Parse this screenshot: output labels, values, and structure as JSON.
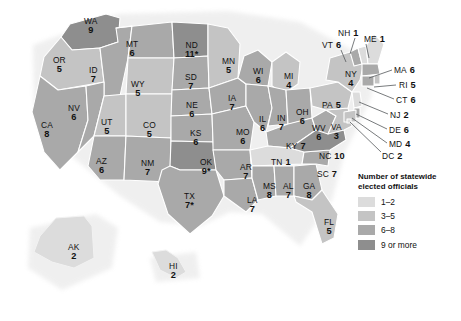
{
  "map": {
    "title": "United States statewide elected officials choropleth map",
    "legend": {
      "title_line1": "Number of statewide",
      "title_line2": "elected officials",
      "items": [
        {
          "label": "1–2",
          "color": "#dcdcdc"
        },
        {
          "label": "3–5",
          "color": "#c4c4c4"
        },
        {
          "label": "6–8",
          "color": "#a9a9a9"
        },
        {
          "label": "9 or more",
          "color": "#8e8e8e"
        }
      ]
    },
    "colors": {
      "bin_1_2": "#dcdcdc",
      "bin_3_5": "#c4c4c4",
      "bin_6_8": "#a9a9a9",
      "bin_9_plus": "#8e8e8e",
      "border": "#ffffff",
      "leader_line": "#55595c",
      "text": "#111111",
      "background": "#ffffff"
    },
    "states": [
      {
        "id": "WA",
        "abbr": "WA",
        "value": "9",
        "bin": "bin_9_plus",
        "x": 84,
        "y": 17,
        "style": "stacked"
      },
      {
        "id": "OR",
        "abbr": "OR",
        "value": "5",
        "bin": "bin_3_5",
        "x": 53,
        "y": 56,
        "style": "stacked"
      },
      {
        "id": "CA",
        "abbr": "CA",
        "value": "8",
        "bin": "bin_6_8",
        "x": 41,
        "y": 121,
        "style": "stacked"
      },
      {
        "id": "ID",
        "abbr": "ID",
        "value": "7",
        "bin": "bin_6_8",
        "x": 89,
        "y": 66,
        "style": "stacked"
      },
      {
        "id": "NV",
        "abbr": "NV",
        "value": "6",
        "bin": "bin_6_8",
        "x": 68,
        "y": 104,
        "style": "stacked"
      },
      {
        "id": "MT",
        "abbr": "MT",
        "value": "6",
        "bin": "bin_6_8",
        "x": 126,
        "y": 40,
        "style": "stacked"
      },
      {
        "id": "WY",
        "abbr": "WY",
        "value": "5",
        "bin": "bin_3_5",
        "x": 131,
        "y": 80,
        "style": "stacked"
      },
      {
        "id": "UT",
        "abbr": "UT",
        "value": "5",
        "bin": "bin_3_5",
        "x": 101,
        "y": 118,
        "style": "stacked"
      },
      {
        "id": "CO",
        "abbr": "CO",
        "value": "5",
        "bin": "bin_3_5",
        "x": 143,
        "y": 121,
        "style": "stacked"
      },
      {
        "id": "AZ",
        "abbr": "AZ",
        "value": "6",
        "bin": "bin_6_8",
        "x": 96,
        "y": 157,
        "style": "stacked"
      },
      {
        "id": "NM",
        "abbr": "NM",
        "value": "7",
        "bin": "bin_6_8",
        "x": 141,
        "y": 159,
        "style": "stacked"
      },
      {
        "id": "ND",
        "abbr": "ND",
        "value": "11*",
        "bin": "bin_9_plus",
        "x": 185,
        "y": 41,
        "style": "stacked"
      },
      {
        "id": "SD",
        "abbr": "SD",
        "value": "7",
        "bin": "bin_6_8",
        "x": 185,
        "y": 73,
        "style": "stacked"
      },
      {
        "id": "NE",
        "abbr": "NE",
        "value": "6",
        "bin": "bin_6_8",
        "x": 186,
        "y": 101,
        "style": "stacked"
      },
      {
        "id": "KS",
        "abbr": "KS",
        "value": "6",
        "bin": "bin_6_8",
        "x": 190,
        "y": 129,
        "style": "stacked"
      },
      {
        "id": "OK",
        "abbr": "OK",
        "value": "9*",
        "bin": "bin_9_plus",
        "x": 200,
        "y": 158,
        "style": "stacked"
      },
      {
        "id": "TX",
        "abbr": "TX",
        "value": "7*",
        "bin": "bin_6_8",
        "x": 184,
        "y": 192,
        "style": "stacked"
      },
      {
        "id": "MN",
        "abbr": "MN",
        "value": "5",
        "bin": "bin_3_5",
        "x": 222,
        "y": 57,
        "style": "stacked"
      },
      {
        "id": "IA",
        "abbr": "IA",
        "value": "7",
        "bin": "bin_6_8",
        "x": 228,
        "y": 94,
        "style": "stacked"
      },
      {
        "id": "MO",
        "abbr": "MO",
        "value": "6",
        "bin": "bin_6_8",
        "x": 236,
        "y": 128,
        "style": "stacked"
      },
      {
        "id": "AR",
        "abbr": "AR",
        "value": "7",
        "bin": "bin_6_8",
        "x": 240,
        "y": 163,
        "style": "stacked"
      },
      {
        "id": "LA",
        "abbr": "LA",
        "value": "7",
        "bin": "bin_6_8",
        "x": 247,
        "y": 196,
        "style": "stacked"
      },
      {
        "id": "WI",
        "abbr": "WI",
        "value": "6",
        "bin": "bin_6_8",
        "x": 253,
        "y": 67,
        "style": "stacked"
      },
      {
        "id": "IL",
        "abbr": "IL",
        "value": "6",
        "bin": "bin_6_8",
        "x": 259,
        "y": 115,
        "style": "stacked"
      },
      {
        "id": "MI",
        "abbr": "MI",
        "value": "4",
        "bin": "bin_3_5",
        "x": 284,
        "y": 72,
        "style": "stacked"
      },
      {
        "id": "IN",
        "abbr": "IN",
        "value": "7",
        "bin": "bin_6_8",
        "x": 277,
        "y": 114,
        "style": "stacked"
      },
      {
        "id": "OH",
        "abbr": "OH",
        "value": "6",
        "bin": "bin_6_8",
        "x": 296,
        "y": 108,
        "style": "stacked"
      },
      {
        "id": "KY",
        "abbr": "KY",
        "value": "7",
        "bin": "bin_6_8",
        "x": 286,
        "y": 142,
        "style": "inline"
      },
      {
        "id": "TN",
        "abbr": "TN",
        "value": "1",
        "bin": "bin_1_2",
        "x": 271,
        "y": 158,
        "style": "inline"
      },
      {
        "id": "MS",
        "abbr": "MS",
        "value": "8",
        "bin": "bin_6_8",
        "x": 263,
        "y": 182,
        "style": "stacked"
      },
      {
        "id": "AL",
        "abbr": "AL",
        "value": "7",
        "bin": "bin_6_8",
        "x": 283,
        "y": 182,
        "style": "stacked"
      },
      {
        "id": "GA",
        "abbr": "GA",
        "value": "8",
        "bin": "bin_6_8",
        "x": 303,
        "y": 182,
        "style": "stacked"
      },
      {
        "id": "FL",
        "abbr": "FL",
        "value": "5",
        "bin": "bin_3_5",
        "x": 324,
        "y": 218,
        "style": "stacked"
      },
      {
        "id": "SC",
        "abbr": "SC",
        "value": "7",
        "bin": "bin_6_8",
        "x": 317,
        "y": 170,
        "style": "inline"
      },
      {
        "id": "NC",
        "abbr": "NC",
        "value": "10",
        "bin": "bin_9_plus",
        "x": 319,
        "y": 152,
        "style": "inline"
      },
      {
        "id": "WV",
        "abbr": "WV",
        "value": "6",
        "bin": "bin_6_8",
        "x": 312,
        "y": 124,
        "style": "stacked"
      },
      {
        "id": "VA",
        "abbr": "VA",
        "value": "3",
        "bin": "bin_3_5",
        "x": 331,
        "y": 123,
        "style": "stacked"
      },
      {
        "id": "PA",
        "abbr": "PA",
        "value": "5",
        "bin": "bin_3_5",
        "x": 322,
        "y": 101,
        "style": "inline"
      },
      {
        "id": "NY",
        "abbr": "NY",
        "value": "4",
        "bin": "bin_3_5",
        "x": 345,
        "y": 70,
        "style": "stacked"
      },
      {
        "id": "AK",
        "abbr": "AK",
        "value": "2",
        "bin": "bin_1_2",
        "x": 68,
        "y": 243,
        "style": "stacked"
      },
      {
        "id": "HI",
        "abbr": "HI",
        "value": "2",
        "bin": "bin_1_2",
        "x": 169,
        "y": 262,
        "style": "stacked"
      }
    ],
    "callouts": [
      {
        "id": "NH",
        "abbr": "NH",
        "value": "1",
        "x": 338,
        "y": 29,
        "lx1": 355,
        "ly1": 38,
        "lx2": 350,
        "ly2": 54
      },
      {
        "id": "VT",
        "abbr": "VT",
        "value": "6",
        "x": 322,
        "y": 41,
        "lx1": 341,
        "ly1": 50,
        "lx2": 346,
        "ly2": 62
      },
      {
        "id": "ME",
        "abbr": "ME",
        "value": "1",
        "x": 364,
        "y": 35,
        "lx1": 366,
        "ly1": 44,
        "lx2": 369,
        "ly2": 58
      },
      {
        "id": "MA",
        "abbr": "MA",
        "value": "6",
        "x": 394,
        "y": 66,
        "lx1": 392,
        "ly1": 70,
        "lx2": 369,
        "ly2": 78
      },
      {
        "id": "RI",
        "abbr": "RI",
        "value": "5",
        "x": 399,
        "y": 81,
        "lx1": 396,
        "ly1": 85,
        "lx2": 374,
        "ly2": 87
      },
      {
        "id": "CT",
        "abbr": "CT",
        "value": "6",
        "x": 396,
        "y": 96,
        "lx1": 394,
        "ly1": 99,
        "lx2": 367,
        "ly2": 88
      },
      {
        "id": "NJ",
        "abbr": "NJ",
        "value": "2",
        "x": 390,
        "y": 111,
        "lx1": 388,
        "ly1": 114,
        "lx2": 359,
        "ly2": 102
      },
      {
        "id": "DE",
        "abbr": "DE",
        "value": "6",
        "x": 389,
        "y": 126,
        "lx1": 387,
        "ly1": 129,
        "lx2": 356,
        "ly2": 114
      },
      {
        "id": "MD",
        "abbr": "MD",
        "value": "4",
        "x": 389,
        "y": 140,
        "lx1": 387,
        "ly1": 143,
        "lx2": 352,
        "ly2": 118
      },
      {
        "id": "DC",
        "abbr": "DC",
        "value": "2",
        "x": 382,
        "y": 152,
        "lx1": 381,
        "ly1": 152,
        "lx2": 350,
        "ly2": 122
      }
    ]
  }
}
